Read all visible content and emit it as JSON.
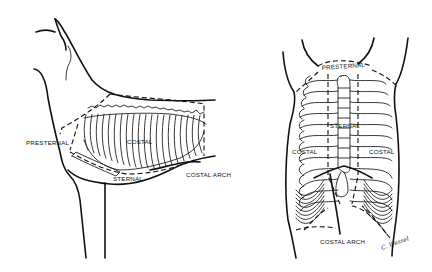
{
  "figure": {
    "lateral_view": {
      "labels": {
        "presternal": "PRESTERNAL",
        "costal": "COSTAL",
        "sternal": "STERNAL",
        "costal_arch": "COSTAL ARCH"
      }
    },
    "ventral_view": {
      "labels": {
        "presternal": "PRESTERNAL",
        "sternal": "STERNAL",
        "costal_left": "COSTAL",
        "costal_right": "COSTAL",
        "costal_arch": "COSTAL ARCH"
      },
      "signature": "C. Wessel"
    }
  }
}
